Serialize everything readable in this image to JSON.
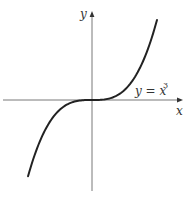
{
  "chart_data": {
    "type": "line",
    "title": "",
    "xlabel": "x",
    "ylabel": "y",
    "curve_label": "y = x",
    "curve_label_exponent": "3",
    "function": "y = x^3",
    "grid": false,
    "ticks": false,
    "legend": "none",
    "xlim": [
      -1.45,
      1.45
    ],
    "ylim": [
      -2.2,
      2.6
    ],
    "series": [
      {
        "name": "y = x^3",
        "x": [
          -1.25,
          -1.0,
          -0.75,
          -0.5,
          -0.25,
          0,
          0.25,
          0.5,
          0.75,
          1.0,
          1.25
        ],
        "y": [
          -1.953,
          -1.0,
          -0.422,
          -0.125,
          -0.016,
          0,
          0.016,
          0.125,
          0.422,
          1.0,
          1.953
        ]
      }
    ],
    "colors": {
      "curve": "#222222",
      "axes": "#555555"
    }
  }
}
